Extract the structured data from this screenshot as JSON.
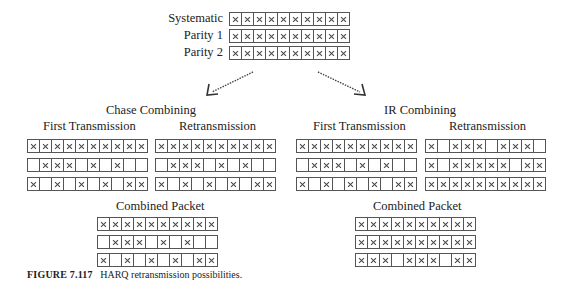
{
  "source": {
    "rows": [
      {
        "label": "Systematic",
        "cells": [
          1,
          1,
          1,
          1,
          1,
          1,
          1,
          1,
          1,
          1
        ]
      },
      {
        "label": "Parity 1",
        "cells": [
          1,
          1,
          1,
          1,
          1,
          1,
          1,
          1,
          1,
          1
        ]
      },
      {
        "label": "Parity 2",
        "cells": [
          1,
          1,
          1,
          1,
          1,
          1,
          1,
          1,
          1,
          1
        ]
      }
    ]
  },
  "chase": {
    "title": "Chase Combining",
    "first": {
      "label": "First Transmission",
      "rows": [
        [
          1,
          1,
          1,
          1,
          1,
          1,
          1,
          1,
          1,
          1
        ],
        [
          0,
          1,
          1,
          1,
          0,
          1,
          0,
          1,
          0,
          0
        ],
        [
          1,
          0,
          1,
          0,
          1,
          0,
          1,
          0,
          1,
          1
        ]
      ]
    },
    "retx": {
      "label": "Retransmission",
      "rows": [
        [
          1,
          1,
          1,
          1,
          1,
          1,
          1,
          1,
          1,
          1
        ],
        [
          0,
          1,
          1,
          1,
          0,
          1,
          0,
          1,
          0,
          0
        ],
        [
          1,
          0,
          1,
          0,
          1,
          0,
          1,
          0,
          1,
          1
        ]
      ]
    },
    "combined": {
      "label": "Combined Packet",
      "rows": [
        [
          1,
          1,
          1,
          1,
          1,
          1,
          1,
          1,
          1,
          1
        ],
        [
          0,
          1,
          1,
          1,
          0,
          1,
          0,
          1,
          0,
          0
        ],
        [
          1,
          0,
          1,
          0,
          1,
          0,
          1,
          0,
          1,
          1
        ]
      ]
    }
  },
  "ir": {
    "title": "IR Combining",
    "first": {
      "label": "First Transmission",
      "rows": [
        [
          1,
          1,
          1,
          1,
          1,
          1,
          1,
          1,
          1,
          1
        ],
        [
          0,
          1,
          1,
          1,
          0,
          1,
          0,
          1,
          0,
          0
        ],
        [
          1,
          0,
          1,
          0,
          1,
          0,
          1,
          0,
          1,
          1
        ]
      ]
    },
    "retx": {
      "label": "Retransmission",
      "rows": [
        [
          1,
          0,
          1,
          1,
          1,
          0,
          1,
          1,
          1,
          0
        ],
        [
          1,
          0,
          1,
          1,
          1,
          1,
          1,
          0,
          1,
          1
        ],
        [
          1,
          1,
          1,
          1,
          1,
          1,
          1,
          1,
          1,
          1
        ]
      ]
    },
    "combined": {
      "label": "Combined Packet",
      "rows": [
        [
          1,
          1,
          1,
          1,
          1,
          1,
          1,
          1,
          1,
          1
        ],
        [
          1,
          1,
          1,
          1,
          1,
          1,
          1,
          1,
          1,
          1
        ],
        [
          1,
          1,
          1,
          0,
          1,
          1,
          1,
          0,
          1,
          1
        ]
      ]
    }
  },
  "caption": {
    "figure": "FIGURE 7.117",
    "text": "HARQ retransmission possibilities."
  }
}
